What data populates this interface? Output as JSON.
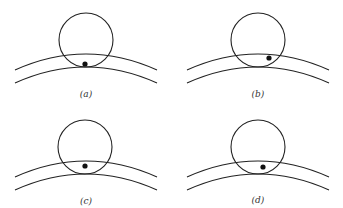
{
  "figure": {
    "colors": {
      "stroke": "#222222",
      "dot": "#111111",
      "background": "#ffffff"
    },
    "panels": [
      {
        "id": "a",
        "label": "(a)",
        "circle": {
          "cx": 86,
          "cy": 40,
          "r": 27
        },
        "upper_arc_peak_y": 54,
        "lower_arc_peak_y": 67,
        "arc_left_x": 15,
        "arc_right_x": 157,
        "dot": {
          "cx": 85,
          "cy": 64
        },
        "label_pos": {
          "x": 86,
          "y": 97
        }
      },
      {
        "id": "b",
        "label": "(b)",
        "circle": {
          "cx": 258,
          "cy": 40,
          "r": 27
        },
        "upper_arc_peak_y": 54,
        "lower_arc_peak_y": 67,
        "arc_left_x": 187,
        "arc_right_x": 329,
        "dot": {
          "cx": 269,
          "cy": 58
        },
        "label_pos": {
          "x": 258,
          "y": 97
        }
      },
      {
        "id": "c",
        "label": "(c)",
        "circle": {
          "cx": 85,
          "cy": 147,
          "r": 27
        },
        "upper_arc_peak_y": 161,
        "lower_arc_peak_y": 174,
        "arc_left_x": 15,
        "arc_right_x": 157,
        "dot": {
          "cx": 85,
          "cy": 166
        },
        "label_pos": {
          "x": 86,
          "y": 204
        }
      },
      {
        "id": "d",
        "label": "(d)",
        "circle": {
          "cx": 258,
          "cy": 147,
          "r": 27
        },
        "upper_arc_peak_y": 161,
        "lower_arc_peak_y": 174,
        "arc_left_x": 187,
        "arc_right_x": 329,
        "dot": {
          "cx": 263,
          "cy": 167
        },
        "label_pos": {
          "x": 258,
          "y": 203
        }
      }
    ]
  }
}
